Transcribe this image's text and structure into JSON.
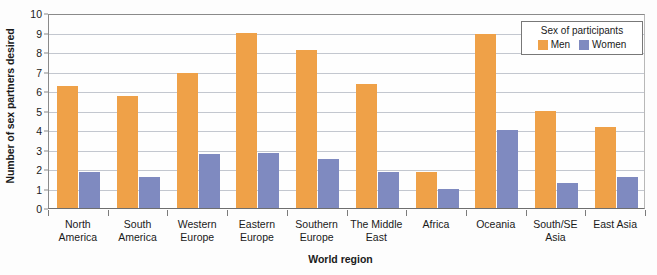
{
  "chart_data": {
    "type": "bar",
    "title": "",
    "xlabel": "World region",
    "ylabel": "Number of sex partners desired",
    "ylim": [
      0,
      10
    ],
    "ytick_step": 1,
    "grid": true,
    "grid_axis": "y",
    "legend_position": "top-right-inside",
    "categories": [
      "North America",
      "South America",
      "Western Europe",
      "Eastern Europe",
      "Southern Europe",
      "The Middle East",
      "Africa",
      "Oceania",
      "South/SE Asia",
      "East Asia"
    ],
    "category_lines": [
      [
        "North",
        "America"
      ],
      [
        "South",
        "America"
      ],
      [
        "Western",
        "Europe"
      ],
      [
        "Eastern",
        "Europe"
      ],
      [
        "Southern",
        "Europe"
      ],
      [
        "The Middle",
        "East"
      ],
      [
        "Africa",
        ""
      ],
      [
        "Oceania",
        ""
      ],
      [
        "South/SE",
        "Asia"
      ],
      [
        "East Asia",
        ""
      ]
    ],
    "ytick_labels": [
      "10",
      "9",
      "8",
      "7",
      "6",
      "5",
      "4",
      "3",
      "2",
      "1",
      "0"
    ],
    "series": [
      {
        "name": "Men",
        "color": "#efa148",
        "values": [
          6.25,
          5.75,
          6.9,
          8.95,
          8.1,
          6.35,
          1.85,
          8.9,
          5.0,
          4.15
        ]
      },
      {
        "name": "Women",
        "color": "#7f8ac0",
        "values": [
          1.85,
          1.6,
          2.75,
          2.8,
          2.5,
          1.85,
          0.95,
          4.0,
          1.3,
          1.6
        ]
      }
    ]
  },
  "legend": {
    "title": "Sex of participants",
    "entries": [
      {
        "label": "Men",
        "swatch": "men"
      },
      {
        "label": "Women",
        "swatch": "women"
      }
    ]
  },
  "colors": {
    "men": "#efa148",
    "women": "#7f8ac0",
    "gridline": "#c3c7cf",
    "axis": "#8a8a8a",
    "text": "#1a1a1a"
  }
}
